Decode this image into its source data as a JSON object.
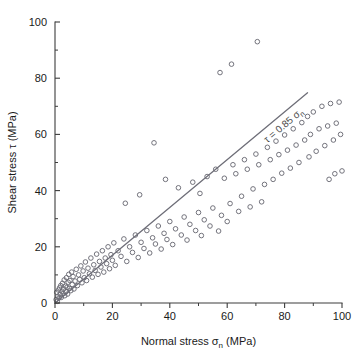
{
  "chart_data": {
    "type": "scatter",
    "title": "",
    "xlabel": "Normal stress σn (MPa)",
    "xlabel_main": "Normal stress",
    "xlabel_symbol": "σ",
    "xlabel_subscript": "n",
    "xlabel_units": "(MPa)",
    "ylabel": "Shear stress τ (MPa)",
    "ylabel_main": "Shear stress",
    "ylabel_symbol": "τ",
    "ylabel_units": "(MPa)",
    "xlim": [
      0,
      100
    ],
    "ylim": [
      0,
      100
    ],
    "xticks": [
      0,
      20,
      40,
      60,
      80,
      100
    ],
    "yticks": [
      0,
      20,
      40,
      60,
      80,
      100
    ],
    "xtick_labels": [
      "0",
      "20",
      "40",
      "60",
      "80",
      "100"
    ],
    "ytick_labels": [
      "0",
      "20",
      "40",
      "60",
      "80",
      "100"
    ],
    "xminor_ticks": [
      10,
      30,
      50,
      70,
      90
    ],
    "yminor_ticks": [
      10,
      30,
      50,
      70,
      90
    ],
    "grid": false,
    "legend": false,
    "marker_style": "open-circle",
    "marker_color": "#6b6b75",
    "marker_radius_px": 2.3,
    "fit_line": {
      "label": "τ = 0.85 σn",
      "label_symbol_tau": "τ",
      "label_equals": "=",
      "label_slope": "0.85",
      "label_symbol_sigma": "σ",
      "label_subscript": "n",
      "slope": 0.85,
      "intercept": 0,
      "x_start": 0,
      "x_end": 88,
      "y_start": 0,
      "y_end": 74.8,
      "color": "#6e6e78"
    },
    "n_points": 152,
    "points": [
      [
        0.4,
        1.2
      ],
      [
        0.6,
        3.8
      ],
      [
        0.8,
        0.6
      ],
      [
        1.0,
        2.4
      ],
      [
        1.2,
        4.6
      ],
      [
        1.4,
        1.8
      ],
      [
        1.6,
        5.4
      ],
      [
        1.8,
        3.0
      ],
      [
        2.0,
        6.2
      ],
      [
        2.2,
        2.0
      ],
      [
        2.4,
        4.2
      ],
      [
        2.6,
        7.0
      ],
      [
        2.8,
        3.4
      ],
      [
        3.0,
        5.0
      ],
      [
        3.2,
        8.2
      ],
      [
        3.4,
        2.6
      ],
      [
        3.6,
        6.0
      ],
      [
        3.8,
        4.0
      ],
      [
        4.0,
        9.0
      ],
      [
        4.2,
        5.6
      ],
      [
        4.4,
        3.2
      ],
      [
        4.6,
        7.4
      ],
      [
        4.8,
        10.2
      ],
      [
        5.0,
        5.2
      ],
      [
        5.2,
        8.0
      ],
      [
        5.5,
        4.4
      ],
      [
        5.8,
        11.0
      ],
      [
        6.0,
        6.6
      ],
      [
        6.3,
        9.4
      ],
      [
        6.6,
        5.0
      ],
      [
        7.0,
        7.8
      ],
      [
        7.4,
        12.0
      ],
      [
        7.8,
        6.2
      ],
      [
        8.2,
        10.0
      ],
      [
        8.6,
        8.4
      ],
      [
        9.0,
        13.2
      ],
      [
        9.4,
        7.2
      ],
      [
        9.8,
        11.4
      ],
      [
        10.2,
        9.0
      ],
      [
        10.6,
        14.6
      ],
      [
        11.0,
        8.0
      ],
      [
        11.5,
        12.4
      ],
      [
        12.0,
        10.4
      ],
      [
        12.5,
        16.0
      ],
      [
        13.0,
        9.2
      ],
      [
        13.5,
        13.6
      ],
      [
        14.0,
        11.6
      ],
      [
        14.5,
        17.4
      ],
      [
        15.0,
        10.2
      ],
      [
        15.5,
        14.8
      ],
      [
        16.0,
        12.8
      ],
      [
        16.5,
        18.6
      ],
      [
        17.0,
        11.0
      ],
      [
        17.5,
        16.0
      ],
      [
        18.0,
        14.0
      ],
      [
        18.5,
        20.0
      ],
      [
        19.0,
        12.2
      ],
      [
        19.5,
        17.2
      ],
      [
        20.0,
        15.2
      ],
      [
        20.5,
        21.4
      ],
      [
        21.0,
        13.4
      ],
      [
        22.0,
        18.6
      ],
      [
        23.0,
        16.6
      ],
      [
        24.0,
        22.8
      ],
      [
        25.0,
        14.8
      ],
      [
        26.0,
        20.0
      ],
      [
        27.0,
        18.0
      ],
      [
        28.0,
        24.2
      ],
      [
        29.0,
        16.2
      ],
      [
        30.0,
        21.6
      ],
      [
        31.0,
        19.4
      ],
      [
        32.0,
        25.8
      ],
      [
        33.0,
        17.8
      ],
      [
        34.0,
        23.2
      ],
      [
        34.5,
        57.0
      ],
      [
        35.0,
        21.0
      ],
      [
        36.0,
        27.4
      ],
      [
        37.0,
        19.2
      ],
      [
        38.0,
        24.8
      ],
      [
        38.5,
        44.0
      ],
      [
        39.0,
        22.6
      ],
      [
        40.0,
        29.0
      ],
      [
        41.0,
        20.8
      ],
      [
        42.0,
        26.4
      ],
      [
        43.0,
        41.0
      ],
      [
        44.0,
        24.2
      ],
      [
        45.0,
        30.6
      ],
      [
        46.0,
        22.4
      ],
      [
        47.0,
        28.0
      ],
      [
        48.0,
        43.0
      ],
      [
        49.0,
        25.8
      ],
      [
        50.0,
        32.2
      ],
      [
        50.5,
        39.0
      ],
      [
        51.0,
        24.0
      ],
      [
        52.0,
        29.6
      ],
      [
        53.0,
        45.0
      ],
      [
        54.0,
        27.4
      ],
      [
        55.0,
        33.8
      ],
      [
        56.0,
        47.6
      ],
      [
        57.0,
        25.6
      ],
      [
        57.5,
        82.0
      ],
      [
        58.0,
        31.2
      ],
      [
        59.0,
        44.4
      ],
      [
        60.0,
        29.0
      ],
      [
        61.0,
        35.4
      ],
      [
        61.5,
        85.0
      ],
      [
        62.0,
        49.2
      ],
      [
        63.0,
        46.0
      ],
      [
        64.0,
        32.6
      ],
      [
        65.0,
        38.0
      ],
      [
        66.0,
        51.0
      ],
      [
        67.0,
        47.6
      ],
      [
        68.0,
        34.2
      ],
      [
        69.0,
        40.6
      ],
      [
        70.0,
        53.0
      ],
      [
        70.5,
        93.0
      ],
      [
        71.0,
        49.2
      ],
      [
        72.0,
        36.0
      ],
      [
        73.0,
        42.2
      ],
      [
        74.0,
        55.4
      ],
      [
        75.0,
        51.0
      ],
      [
        76.0,
        44.0
      ],
      [
        77.0,
        57.6
      ],
      [
        78.0,
        52.8
      ],
      [
        79.0,
        46.2
      ],
      [
        80.0,
        59.8
      ],
      [
        81.0,
        54.4
      ],
      [
        82.0,
        48.0
      ],
      [
        83.0,
        62.0
      ],
      [
        84.0,
        56.2
      ],
      [
        85.0,
        50.0
      ],
      [
        86.0,
        64.2
      ],
      [
        87.0,
        58.0
      ],
      [
        88.0,
        66.4
      ],
      [
        88.5,
        52.0
      ],
      [
        89.0,
        60.0
      ],
      [
        90.0,
        68.0
      ],
      [
        91.0,
        54.0
      ],
      [
        92.0,
        62.0
      ],
      [
        93.0,
        70.0
      ],
      [
        94.0,
        56.0
      ],
      [
        95.0,
        63.0
      ],
      [
        95.5,
        44.0
      ],
      [
        96.0,
        71.0
      ],
      [
        97.0,
        58.0
      ],
      [
        97.5,
        46.0
      ],
      [
        98.0,
        64.0
      ],
      [
        99.0,
        71.5
      ],
      [
        99.5,
        60.0
      ],
      [
        100.0,
        47.0
      ],
      [
        24.5,
        35.5
      ],
      [
        29.5,
        38.5
      ]
    ]
  }
}
